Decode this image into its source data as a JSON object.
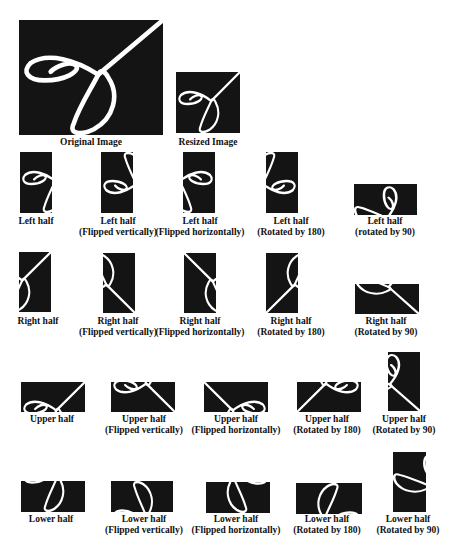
{
  "figure": {
    "original": {
      "label": "Original Image"
    },
    "resized": {
      "label": "Resized Image"
    },
    "rows": [
      {
        "name": "left-half",
        "items": [
          {
            "line1": "Left half",
            "line2": ""
          },
          {
            "line1": "Left half",
            "line2": "(Flipped vertically)"
          },
          {
            "line1": "Left half",
            "line2": "(Flipped horizontally)"
          },
          {
            "line1": "Left half",
            "line2": "(Rotated by 180)"
          },
          {
            "line1": "Left half",
            "line2": "(rotated by 90)"
          }
        ]
      },
      {
        "name": "right-half",
        "items": [
          {
            "line1": "Right half",
            "line2": ""
          },
          {
            "line1": "Right half",
            "line2": "(Flipped vertically)"
          },
          {
            "line1": "Right half",
            "line2": "(Flipped horizontally)"
          },
          {
            "line1": "Right half",
            "line2": "(Rotated by 180)"
          },
          {
            "line1": "Right half",
            "line2": "(Rotated by 90)"
          }
        ]
      },
      {
        "name": "upper-half",
        "items": [
          {
            "line1": "Upper half",
            "line2": ""
          },
          {
            "line1": "Upper half",
            "line2": "(Flipped vertically)"
          },
          {
            "line1": "Upper half",
            "line2": "(Flipped horizontally)"
          },
          {
            "line1": "Upper half",
            "line2": "(Rotated by 180)"
          },
          {
            "line1": "Upper half",
            "line2": "(Rotated by 90)"
          }
        ]
      },
      {
        "name": "lower-half",
        "items": [
          {
            "line1": "Lower half",
            "line2": ""
          },
          {
            "line1": "Lower half",
            "line2": "(Flipped vertically)"
          },
          {
            "line1": "Lower half",
            "line2": "(Flipped horizontally)"
          },
          {
            "line1": "Lower half",
            "line2": "(Rotated by 180)"
          },
          {
            "line1": "Lower half",
            "line2": "(Rotated by 90)"
          }
        ]
      }
    ],
    "colors": {
      "image_bg": "#141414",
      "stroke": "#ffffff",
      "text": "#111111"
    }
  }
}
